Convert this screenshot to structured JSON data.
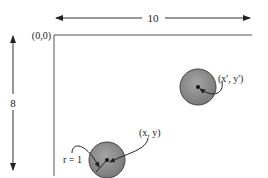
{
  "diagram": {
    "width_dimension": {
      "label": "10"
    },
    "height_dimension": {
      "label": "8"
    },
    "origin": {
      "label": "(0,0)"
    },
    "circles": [
      {
        "id": "circle-a",
        "center_label": "(x, y)",
        "radius_label": "r = 1"
      },
      {
        "id": "circle-b",
        "center_label": "(x', y')"
      }
    ],
    "colors": {
      "circle_fill": "#8c8c8c",
      "circle_stroke": "#444444",
      "line": "#333333"
    }
  }
}
